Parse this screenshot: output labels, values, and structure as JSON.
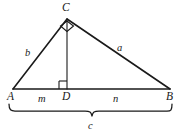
{
  "figure": {
    "stroke_color": "#1a1a1a",
    "background_color": "#ffffff",
    "labels": {
      "vertex_C": "C",
      "vertex_A": "A",
      "vertex_D": "D",
      "vertex_B": "B",
      "side_b": "b",
      "side_a": "a",
      "segment_m": "m",
      "segment_n": "n",
      "segment_c": "c"
    },
    "geometry": {
      "points": {
        "A": [
          13,
          89
        ],
        "B": [
          170,
          89
        ],
        "C": [
          67,
          19
        ],
        "D": [
          67,
          89
        ]
      },
      "segments": [
        {
          "name": "AB-base",
          "from": "A",
          "to": "B"
        },
        {
          "name": "AC-leg-b",
          "from": "A",
          "to": "C"
        },
        {
          "name": "CB-leg-a",
          "from": "C",
          "to": "B"
        },
        {
          "name": "CD-altitude",
          "from": "C",
          "to": "D"
        }
      ],
      "right_angles": [
        {
          "name": "right-angle-at-C",
          "vertex": "C"
        },
        {
          "name": "right-angle-at-D",
          "vertex": "D"
        }
      ],
      "brace": {
        "name": "brace-c",
        "x_start": 8,
        "x_end": 172,
        "y": 106
      }
    }
  }
}
